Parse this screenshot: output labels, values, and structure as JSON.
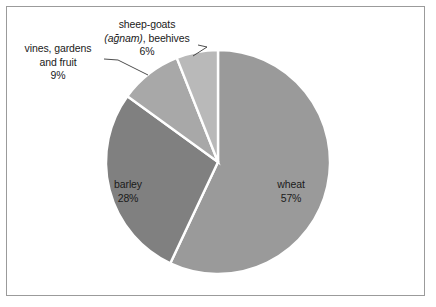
{
  "figure": {
    "background_color": "#ffffff",
    "frame_color": "#9b9b9b",
    "slice_separator_color": "#ffffff",
    "text_color": "#1a1a1a"
  },
  "labels": {
    "sheep": {
      "line1": "sheep-goats",
      "line2_italic": "(ağnam)",
      "line2_rest": ", beehives",
      "line3": "6%"
    },
    "vines": {
      "line1": "vines, gardens",
      "line2": "and fruit",
      "line3": "9%"
    },
    "wheat": {
      "line1": "wheat",
      "line2": "57%"
    },
    "barley": {
      "line1": "barley",
      "line2": "28%"
    }
  },
  "chart_data": {
    "type": "pie",
    "title": "",
    "subtitle": "",
    "xlabel": "",
    "ylabel": "",
    "legend_position": "none",
    "grid": false,
    "labels_inside": [
      "wheat",
      "barley"
    ],
    "labels_outside": [
      "vines, gardens and fruit",
      "sheep-goats (ağnam), beehives"
    ],
    "start_angle_deg": 0,
    "direction": "clockwise",
    "center": [
      218,
      162
    ],
    "radius": 112,
    "categories": [
      "wheat",
      "barley",
      "vines, gardens and fruit",
      "sheep-goats (ağnam), beehives"
    ],
    "values": [
      57,
      28,
      9,
      6
    ],
    "value_unit": "%",
    "colors": [
      "#9a9a9a",
      "#808080",
      "#a8a8a8",
      "#b9b9b9"
    ],
    "slices": [
      {
        "label": "wheat",
        "value": 57,
        "display": "57%",
        "color": "#9a9a9a"
      },
      {
        "label": "barley",
        "value": 28,
        "display": "28%",
        "color": "#808080"
      },
      {
        "label": "vines, gardens and fruit",
        "value": 9,
        "display": "9%",
        "color": "#a8a8a8"
      },
      {
        "label": "sheep-goats (ağnam), beehives",
        "value": 6,
        "display": "6%",
        "color": "#b9b9b9"
      }
    ]
  }
}
